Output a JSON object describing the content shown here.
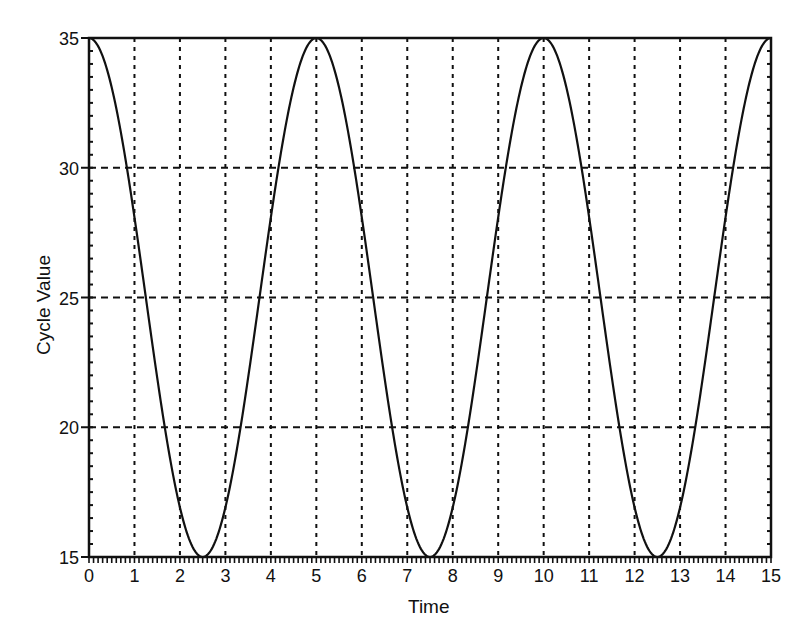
{
  "chart_data": {
    "type": "line",
    "title": "",
    "xlabel": "Time",
    "ylabel": "Cycle Value",
    "xlim": [
      0,
      15
    ],
    "ylim": [
      15,
      35
    ],
    "x_ticks": [
      0,
      1,
      2,
      3,
      4,
      5,
      6,
      7,
      8,
      9,
      10,
      11,
      12,
      13,
      14,
      15
    ],
    "y_ticks": [
      15,
      20,
      25,
      30,
      35
    ],
    "x_minor_ticks_per_unit": 10,
    "grid": true,
    "legend": null,
    "series": [
      {
        "name": "Cycle Value",
        "function": "25 + 10*cos(2*pi*t/5)",
        "x": [
          0,
          0.5,
          1,
          1.5,
          2,
          2.5,
          3,
          3.5,
          4,
          4.5,
          5,
          5.5,
          6,
          6.5,
          7,
          7.5,
          8,
          8.5,
          9,
          9.5,
          10,
          10.5,
          11,
          11.5,
          12,
          12.5,
          13,
          13.5,
          14,
          14.5,
          15
        ],
        "values": [
          35,
          33.09,
          28.09,
          21.91,
          16.91,
          15,
          16.91,
          21.91,
          28.09,
          33.09,
          35,
          33.09,
          28.09,
          21.91,
          16.91,
          15,
          16.91,
          21.91,
          28.09,
          33.09,
          35,
          33.09,
          28.09,
          21.91,
          16.91,
          15,
          16.91,
          21.91,
          28.09,
          33.09,
          35
        ]
      }
    ],
    "colors": {
      "line": "#111111",
      "grid": "#111111",
      "background": "#ffffff"
    }
  }
}
